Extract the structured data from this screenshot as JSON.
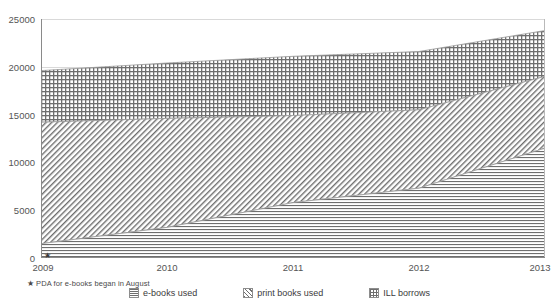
{
  "chart_data": {
    "type": "area",
    "stacked": true,
    "title": "",
    "xlabel": "",
    "ylabel": "",
    "x": [
      2009,
      2010,
      2011,
      2012,
      2013
    ],
    "categories": [
      "2009",
      "2010",
      "2011",
      "2012",
      "2013"
    ],
    "xtick_labels": [
      "2009",
      "2010",
      "2011",
      "2012",
      "2013"
    ],
    "ytick_labels": [
      "0",
      "5000",
      "10000",
      "15000",
      "20000",
      "25000"
    ],
    "ytick_values": [
      0,
      5000,
      10000,
      15000,
      20000,
      25000
    ],
    "ylim": [
      0,
      25000
    ],
    "xlim": [
      2009,
      2013
    ],
    "grid": "horizontal",
    "legend_position": "bottom",
    "series": [
      {
        "name": "e-books used",
        "pattern": "horizontal-lines",
        "color": "#6e6e6e",
        "values": [
          1500,
          3200,
          5800,
          7300,
          11500
        ]
      },
      {
        "name": "print books used",
        "pattern": "diagonal-hatch",
        "color": "#6e6e6e",
        "values": [
          12700,
          11400,
          9100,
          8200,
          7500
        ]
      },
      {
        "name": "ILL borrows",
        "pattern": "crosshatch-grid",
        "color": "#6e6e6e",
        "values": [
          5400,
          5800,
          6200,
          6100,
          4800
        ]
      }
    ],
    "cumulative_tops": {
      "e-books used": [
        1500,
        3200,
        5800,
        7300,
        11500
      ],
      "print books used": [
        14200,
        14600,
        14900,
        15500,
        19000
      ],
      "ILL borrows": [
        19600,
        20400,
        21100,
        21600,
        23800
      ]
    },
    "annotations": [
      {
        "name": "pda-star-marker",
        "symbol": "★",
        "x": 2009,
        "y": 0
      }
    ],
    "footnote": {
      "star": "★",
      "text": "PDA for e-books began in August"
    }
  },
  "legend": {
    "items": [
      {
        "label": "e-books used",
        "swatch": "horizontal-lines-swatch"
      },
      {
        "label": "print books used",
        "swatch": "diagonal-hatch-swatch"
      },
      {
        "label": "ILL borrows",
        "swatch": "crosshatch-grid-swatch"
      }
    ]
  },
  "colors": {
    "gridline": "#d9d9d9",
    "axis": "#8a8a8a",
    "text": "#3b3b3b",
    "tick_text": "#555555",
    "pattern_ink": "#6e6e6e",
    "background": "#ffffff"
  }
}
